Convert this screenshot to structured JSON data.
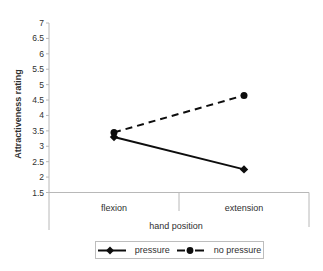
{
  "chart_data": {
    "type": "line",
    "title": "",
    "xlabel": "hand position",
    "ylabel": "Attractiveness rating",
    "categories": [
      "flexion",
      "extension"
    ],
    "series": [
      {
        "name": "pressure",
        "marker": "diamond",
        "line_style": "solid",
        "color": "#0d0d0d",
        "values": [
          3.3,
          2.25
        ]
      },
      {
        "name": "no pressure",
        "marker": "circle",
        "line_style": "dashed",
        "color": "#0d0d0d",
        "values": [
          3.45,
          4.65
        ]
      }
    ],
    "ylim": [
      1.5,
      7
    ],
    "ytick_step": 0.5,
    "ytick_labels": [
      "7",
      "6.5",
      "6",
      "5.5",
      "5",
      "4.5",
      "4",
      "3.5",
      "3",
      "2.5",
      "2",
      "1.5"
    ],
    "grid": false,
    "legend_position": "bottom",
    "axis_color": "#b8b8b8",
    "text_color": "#2f2f2f"
  }
}
